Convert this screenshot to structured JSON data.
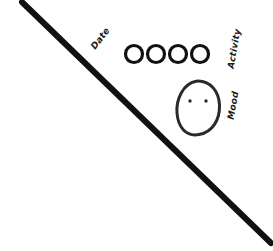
{
  "canvas": {
    "width": 273,
    "height": 251,
    "background_color": "#ffffff",
    "ink_color": "#111111"
  },
  "diagonal_line": {
    "name": "diagonal-divider-line",
    "x1": 22,
    "y1": 2,
    "x2": 271,
    "y2": 243,
    "stroke_width": 6,
    "color": "#111111"
  },
  "labels": {
    "date": "Date",
    "activity": "Activity",
    "mood": "Mood"
  },
  "activity_circles": {
    "count": 4,
    "radius": 8.5,
    "stroke_width": 3.2,
    "color": "#111111",
    "centers": [
      {
        "cx": 134,
        "cy": 54
      },
      {
        "cx": 156,
        "cy": 54
      },
      {
        "cx": 178,
        "cy": 54
      },
      {
        "cx": 200,
        "cy": 54
      }
    ]
  },
  "mood_face": {
    "name": "mood-face",
    "outline_color": "#2a2a2a",
    "outline_width": 3,
    "cx": 198,
    "cy": 108,
    "rx": 21,
    "ry": 27,
    "eyes": [
      {
        "cx": 190,
        "cy": 101,
        "r": 1.7
      },
      {
        "cx": 206,
        "cy": 101,
        "r": 1.7
      }
    ],
    "mouth": null
  }
}
